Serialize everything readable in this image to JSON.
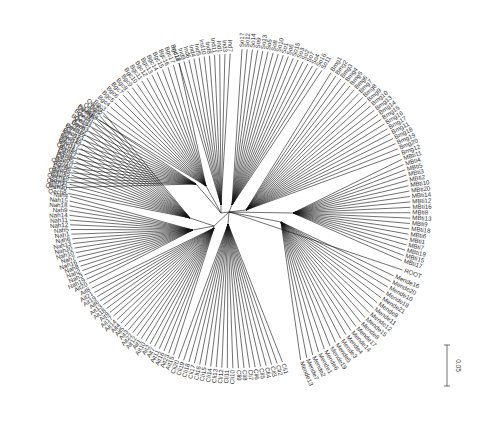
{
  "chart_data": {
    "type": "radial-phylogenetic-tree",
    "title": "",
    "center": [
      236,
      210
    ],
    "scale_bar": {
      "label": "0.05",
      "x": 447,
      "y1": 345,
      "y2": 386
    },
    "root_label": "ROOT",
    "internal_nodes": [
      {
        "id": "hub_a",
        "x": 221,
        "y": 213
      },
      {
        "id": "hub_b",
        "x": 229,
        "y": 212
      },
      {
        "id": "hub_c",
        "x": 214,
        "y": 226
      }
    ],
    "clades": [
      {
        "name": "Bgvi",
        "node": [
          196,
          184
        ],
        "a0": 188,
        "a1": 215,
        "r": 175,
        "count": 16,
        "leaves": [
          "Bgvi1",
          "Bgvi8",
          "Bgvi2",
          "Bgvi3",
          "Bgvi5",
          "Bgvi7",
          "Bgvi4",
          "Bgvi9",
          "Bgvi11",
          "Bgvi14",
          "Bgvi12",
          "Bgvi10",
          "Bgvi6",
          "Bgvi13",
          "Bgvi15",
          "Bgvi16"
        ]
      },
      {
        "name": "Bgc",
        "node": [
          206,
          186
        ],
        "a0": 215,
        "a1": 250,
        "r": 170,
        "count": 18,
        "leaves": [
          "Bgc1",
          "Bgc2",
          "Bgc3",
          "Bgc4",
          "Bgc5",
          "Bgc6",
          "Bgc7",
          "Bgc8",
          "Bgc9",
          "Bgc10",
          "Bgc11",
          "Bgc12",
          "Bgc13",
          "Bgc14",
          "Bgc15",
          "Bgc16",
          "Bgc17",
          "Bgc18"
        ]
      },
      {
        "name": "Ind",
        "node": [
          221,
          205
        ],
        "a0": 250,
        "a1": 268,
        "r": 170,
        "count": 11,
        "leaves": [
          "Ind12",
          "Ind9",
          "Ind6",
          "Ind4",
          "Ind5",
          "Ind10",
          "Ind8",
          "Ind11",
          "Ind1",
          "Ind3",
          "Ind7"
        ]
      },
      {
        "name": "So",
        "node": [
          232,
          205
        ],
        "a0": 272,
        "a1": 300,
        "r": 175,
        "count": 17,
        "leaves": [
          "So17",
          "So12",
          "So14",
          "So9",
          "So13",
          "So5",
          "So8",
          "So10",
          "So1",
          "So6",
          "So15",
          "So3",
          "So2",
          "So7",
          "So4",
          "So16",
          "So11"
        ]
      },
      {
        "name": "Bmg",
        "node": [
          246,
          210
        ],
        "a0": 303,
        "a1": 340,
        "r": 178,
        "count": 20,
        "leaves": [
          "Bmg1",
          "Bmg2",
          "Bmg3",
          "Bmg4",
          "Bmg5",
          "Bmg6",
          "Bmg7",
          "Bmg8",
          "Bmg9",
          "Bmg10",
          "Bmg13",
          "Bmg14",
          "Bmg15",
          "Bmg16",
          "Bmg17",
          "Bmg11",
          "Bmg18",
          "Bmg19",
          "Bmg20",
          "Bmg12"
        ]
      },
      {
        "name": "MBti",
        "node": [
          293,
          213
        ],
        "a0": 342,
        "a1": 378,
        "r": 178,
        "count": 20,
        "leaves": [
          "MBti11",
          "MBti4",
          "MBti5",
          "MBti3",
          "MBti2",
          "MBti10",
          "MBti20",
          "MBti14",
          "MBti12",
          "MBti16",
          "MBti8",
          "MBti13",
          "MBti9",
          "MBti18",
          "MBti6",
          "MBti1",
          "MBti7",
          "MBti19",
          "MBti15",
          "MBti17"
        ]
      },
      {
        "name": "ROOT",
        "node": [
          236,
          214
        ],
        "a0": 381,
        "a1": 381,
        "r": 182,
        "count": 1,
        "leaves": [
          "ROOT"
        ]
      },
      {
        "name": "Mende",
        "node": [
          281,
          222
        ],
        "a0": 384,
        "a1": 428,
        "r": 176,
        "count": 21,
        "leaves": [
          "Mende16",
          "Mende20",
          "Mende10",
          "Mende18",
          "Mende21",
          "Mende9",
          "Mende11",
          "Mende12",
          "Mende15",
          "Mende8",
          "Mende17",
          "Mende14",
          "Mende4",
          "Mende3",
          "Mende5",
          "Mende19",
          "Mende6",
          "Mende1",
          "Mende2",
          "Mende7",
          "Mende13"
        ]
      },
      {
        "name": "Cli",
        "node": [
          228,
          224
        ],
        "a0": 434,
        "a1": 470,
        "r": 172,
        "count": 20,
        "leaves": [
          "Cli1",
          "Cli2",
          "Cli3",
          "Cli4",
          "Cli5",
          "Cli6",
          "Cli7",
          "Cli8",
          "Cli9",
          "Cli10",
          "Cli11",
          "Cli12",
          "Cli13",
          "Cli14",
          "Cli15",
          "Cli16",
          "Cli17",
          "Cli18",
          "Cli19",
          "Cli20"
        ]
      },
      {
        "name": "Ait",
        "node": [
          214,
          228
        ],
        "a0": 472,
        "a1": 510,
        "r": 170,
        "count": 22,
        "leaves": [
          "Ait15",
          "Ait23",
          "Ait16",
          "Ait11",
          "Ait7",
          "Ait2",
          "Ait10",
          "Ait1",
          "Ait12",
          "Ait22",
          "Ait3",
          "Ait5",
          "Ait4",
          "Ait14",
          "Ait17",
          "Ait9",
          "Ait18",
          "Ait13",
          "Ait6",
          "Ait19",
          "Ait21",
          "Ait8"
        ]
      },
      {
        "name": "Nah",
        "node": [
          193,
          230
        ],
        "a0": 512,
        "a1": 545,
        "r": 170,
        "count": 20,
        "leaves": [
          "Ait20",
          "Nah19",
          "Nah3",
          "Nah2",
          "Nah8",
          "Nah16",
          "Nah7",
          "Nah10",
          "Nah20",
          "Nah13",
          "Nah6",
          "Nah1",
          "Nah5",
          "Nah12",
          "Nah11",
          "Nah14",
          "Nah9",
          "Nah18",
          "Nah15",
          "Nah4"
        ]
      },
      {
        "name": "Qech",
        "node": [
          190,
          218
        ],
        "a0": 546,
        "a1": 578,
        "r": 172,
        "count": 20,
        "leaves": [
          "Qech8",
          "Qech20",
          "Qech11",
          "Qech18",
          "Qech15",
          "Qech6",
          "Qech10",
          "Qech5",
          "Qech2",
          "Qech14",
          "Qech17",
          "Qech19",
          "Qech13",
          "Qech16",
          "Qech3",
          "Qech4",
          "Qech1",
          "Qech12",
          "Qech7",
          "Qech9"
        ]
      }
    ]
  }
}
